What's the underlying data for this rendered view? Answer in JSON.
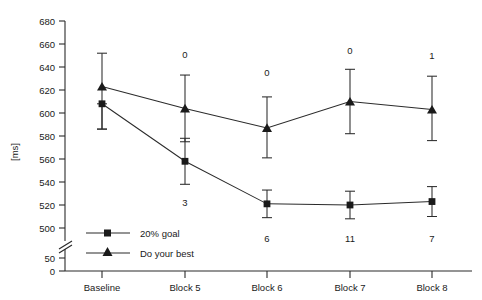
{
  "chart_data": {
    "type": "line",
    "title": "",
    "xlabel": "",
    "ylabel": "[ms]",
    "categories": [
      "Baseline",
      "Block 5",
      "Block 6",
      "Block 7",
      "Block 8"
    ],
    "yticks": [
      0,
      50,
      500,
      520,
      540,
      560,
      580,
      600,
      620,
      640,
      660,
      680
    ],
    "ylim": [
      0,
      690
    ],
    "axis_break": true,
    "axis_break_between": [
      50,
      500
    ],
    "grid": false,
    "legend_position": "lower-left-inside",
    "series": [
      {
        "name": "20% goal",
        "marker": "square",
        "values": [
          608,
          558,
          521,
          520,
          523
        ],
        "err_upper": [
          608,
          578,
          533,
          532,
          536
        ],
        "err_lower": [
          586,
          538,
          509,
          508,
          510
        ],
        "annotations": [
          "",
          "3",
          "6",
          "11",
          "7"
        ],
        "annotation_side": "below"
      },
      {
        "name": "Do your best",
        "marker": "triangle",
        "values": [
          623,
          604,
          587,
          610,
          603
        ],
        "err_upper": [
          652,
          633,
          614,
          638,
          632
        ],
        "err_lower": [
          586,
          575,
          561,
          582,
          576
        ],
        "annotations": [
          "",
          "0",
          "0",
          "0",
          "1"
        ],
        "annotation_side": "above"
      }
    ]
  },
  "axis": {
    "y_label": "[ms]",
    "y_tick_labels": [
      "680",
      "660",
      "640",
      "620",
      "600",
      "580",
      "560",
      "540",
      "520",
      "500",
      "50",
      "0"
    ],
    "x_tick_labels": [
      "Baseline",
      "Block 5",
      "Block 6",
      "Block 7",
      "Block 8"
    ]
  },
  "annotations": {
    "top_row": [
      "0",
      "0",
      "0",
      "1"
    ],
    "bottom_row": [
      "3",
      "6",
      "11",
      "7"
    ]
  },
  "legend": {
    "entries": [
      {
        "label": "20% goal",
        "marker": "square-marker"
      },
      {
        "label": "Do your best",
        "marker": "triangle-marker"
      }
    ]
  },
  "colors": {
    "ink": "#1a1a1a",
    "axis": "#2b2b2b",
    "background": "#ffffff"
  }
}
